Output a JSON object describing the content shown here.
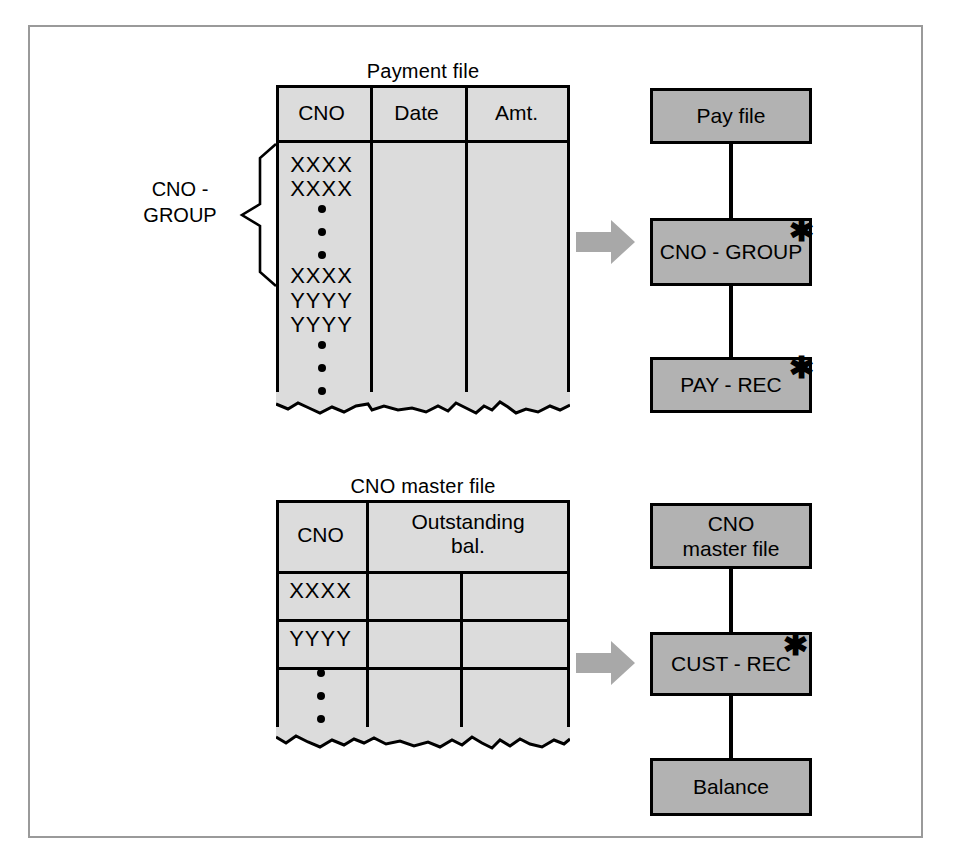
{
  "diagram": {
    "colors": {
      "sheet_fill": "#dcdcdc",
      "box_fill": "#b2b2b2",
      "line": "#000000",
      "arrow_fill": "#a8a8a8",
      "frame": "#9a9a9a"
    }
  },
  "section_top": {
    "file": {
      "title": "Payment file",
      "columns": [
        "CNO",
        "Date",
        "Amt."
      ],
      "cno_entries": [
        "XXXX",
        "XXXX",
        "dot",
        "dot",
        "dot",
        "XXXX",
        "YYYY",
        "YYYY",
        "dot",
        "dot",
        "dot"
      ],
      "brace_label": "CNO -\nGROUP"
    },
    "arrow": "block-arrow-right",
    "boxes": [
      {
        "label": "Pay file",
        "starred": false,
        "star": ""
      },
      {
        "label": "CNO - GROUP",
        "starred": true,
        "star": "✱"
      },
      {
        "label": "PAY - REC",
        "starred": true,
        "star": "✱"
      }
    ]
  },
  "section_bottom": {
    "file": {
      "title": "CNO master file",
      "columns": [
        "CNO",
        "Outstanding\nbal."
      ],
      "rows": [
        "XXXX",
        "YYYY",
        "dots"
      ]
    },
    "arrow": "block-arrow-right",
    "boxes": [
      {
        "label": "CNO\nmaster file",
        "starred": false,
        "star": ""
      },
      {
        "label": "CUST - REC",
        "starred": true,
        "star": "✱"
      },
      {
        "label": "Balance",
        "starred": false,
        "star": ""
      }
    ]
  }
}
